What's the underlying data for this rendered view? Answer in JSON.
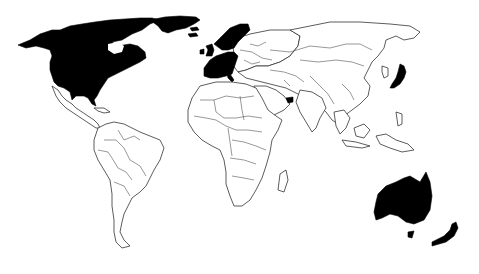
{
  "map": {
    "type": "world-choropleth",
    "projection": "equirectangular-like",
    "background_color": "#ffffff",
    "highlight_color": "#000000",
    "base_color": "#ffffff",
    "border_color": "#333333",
    "highlighted_regions": [
      "Canada",
      "United States",
      "Greenland",
      "United Kingdom",
      "Ireland",
      "Norway",
      "Sweden",
      "Finland",
      "Denmark",
      "Iceland",
      "France",
      "Spain",
      "Portugal",
      "Germany",
      "Netherlands",
      "Belgium",
      "Switzerland",
      "Austria",
      "Italy",
      "Japan",
      "Australia",
      "New Zealand",
      "United Arab Emirates"
    ],
    "text_labels": []
  }
}
